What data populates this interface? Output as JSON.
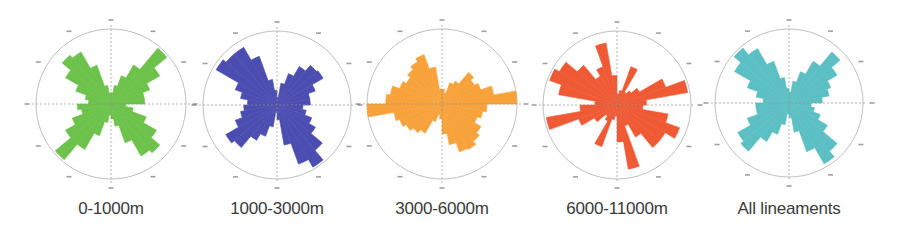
{
  "chart_data": [
    {
      "type": "rose",
      "title": "0-1000m",
      "label": "0-1000m",
      "color": "#6cc24a",
      "center": [
        111,
        104
      ],
      "radius": 75,
      "bin_width_deg": 10,
      "bin_starts_deg": [
        0,
        10,
        20,
        30,
        40,
        50,
        60,
        70,
        80,
        90,
        100,
        110,
        120,
        130,
        140,
        150,
        160,
        170,
        180,
        190,
        200,
        210,
        220,
        230,
        240,
        250,
        260,
        270,
        280,
        290,
        300,
        310,
        320,
        330,
        340,
        350
      ],
      "values": [
        0.15,
        0.25,
        0.4,
        0.6,
        0.97,
        0.75,
        0.55,
        0.45,
        0.45,
        0.2,
        0.3,
        0.5,
        0.7,
        0.85,
        0.8,
        0.55,
        0.3,
        0.2,
        0.15,
        0.25,
        0.45,
        0.7,
        0.97,
        0.7,
        0.55,
        0.4,
        0.45,
        0.3,
        0.35,
        0.5,
        0.7,
        0.85,
        0.8,
        0.55,
        0.25,
        0.15
      ],
      "value_scale": "fraction of outer circle radius",
      "grid": true,
      "direction_ticks": [
        "N",
        "E",
        "S",
        "W"
      ]
    },
    {
      "type": "rose",
      "title": "1000-3000m",
      "label": "1000-3000m",
      "color": "#4b4db0",
      "center": [
        277,
        105
      ],
      "radius": 74,
      "bin_width_deg": 10,
      "bin_starts_deg": [
        0,
        10,
        20,
        30,
        40,
        50,
        60,
        70,
        80,
        90,
        100,
        110,
        120,
        130,
        140,
        150,
        160,
        170,
        180,
        190,
        200,
        210,
        220,
        230,
        240,
        250,
        260,
        270,
        280,
        290,
        300,
        310,
        320,
        330,
        340,
        350
      ],
      "values": [
        0.1,
        0.3,
        0.45,
        0.6,
        0.7,
        0.72,
        0.55,
        0.45,
        0.45,
        0.35,
        0.4,
        0.5,
        0.6,
        0.8,
        0.97,
        0.85,
        0.55,
        0.2,
        0.1,
        0.3,
        0.45,
        0.55,
        0.75,
        0.8,
        0.6,
        0.5,
        0.45,
        0.4,
        0.5,
        0.6,
        0.95,
        0.9,
        0.9,
        0.7,
        0.35,
        0.2
      ],
      "value_scale": "fraction of outer circle radius",
      "grid": true,
      "direction_ticks": [
        "N",
        "E",
        "S",
        "W"
      ]
    },
    {
      "type": "rose",
      "title": "3000-6000m",
      "label": "3000-6000m",
      "color": "#f7a23b",
      "center": [
        442,
        104
      ],
      "radius": 75,
      "bin_width_deg": 10,
      "bin_starts_deg": [
        0,
        10,
        20,
        30,
        40,
        50,
        60,
        70,
        80,
        90,
        100,
        110,
        120,
        130,
        140,
        150,
        160,
        170,
        180,
        190,
        200,
        210,
        220,
        230,
        240,
        250,
        260,
        270,
        280,
        290,
        300,
        310,
        320,
        330,
        340,
        350
      ],
      "values": [
        0.2,
        0.15,
        0.3,
        0.35,
        0.55,
        0.5,
        0.55,
        0.7,
        1.0,
        0.6,
        0.55,
        0.5,
        0.6,
        0.65,
        0.7,
        0.68,
        0.55,
        0.4,
        0.2,
        0.15,
        0.25,
        0.45,
        0.5,
        0.55,
        0.6,
        0.65,
        1.0,
        0.75,
        0.7,
        0.6,
        0.55,
        0.6,
        0.65,
        0.7,
        0.5,
        0.2
      ],
      "value_scale": "fraction of outer circle radius",
      "grid": true,
      "direction_ticks": [
        "N",
        "E",
        "S",
        "W"
      ]
    },
    {
      "type": "rose",
      "title": "6000-11000m",
      "label": "6000-11000m",
      "color": "#ef5a35",
      "center": [
        617,
        105
      ],
      "radius": 74,
      "bin_width_deg": 10,
      "bin_starts_deg": [
        0,
        10,
        20,
        30,
        40,
        50,
        60,
        70,
        80,
        90,
        100,
        110,
        120,
        130,
        140,
        150,
        160,
        170,
        180,
        190,
        200,
        210,
        220,
        230,
        240,
        250,
        260,
        270,
        280,
        290,
        300,
        310,
        320,
        330,
        340,
        350
      ],
      "values": [
        0.15,
        0.2,
        0.55,
        0.2,
        0.25,
        0.35,
        0.7,
        0.97,
        0.4,
        0.35,
        0.7,
        0.9,
        0.75,
        0.75,
        0.5,
        0.3,
        0.88,
        0.5,
        0.15,
        0.2,
        0.6,
        0.25,
        0.2,
        0.35,
        0.55,
        0.97,
        0.5,
        0.3,
        0.8,
        0.97,
        0.9,
        0.7,
        0.45,
        0.55,
        0.85,
        0.4
      ],
      "value_scale": "fraction of outer circle radius",
      "grid": true,
      "direction_ticks": [
        "N",
        "E",
        "S",
        "W"
      ]
    },
    {
      "type": "rose",
      "title": "All lineaments",
      "label": "All lineaments",
      "color": "#5cbfc3",
      "center": [
        789,
        103
      ],
      "radius": 74,
      "bin_width_deg": 10,
      "bin_starts_deg": [
        0,
        10,
        20,
        30,
        40,
        50,
        60,
        70,
        80,
        90,
        100,
        110,
        120,
        130,
        140,
        150,
        160,
        170,
        180,
        190,
        200,
        210,
        220,
        230,
        240,
        250,
        260,
        270,
        280,
        290,
        300,
        310,
        320,
        330,
        340,
        350
      ],
      "values": [
        0.15,
        0.3,
        0.45,
        0.65,
        0.9,
        0.75,
        0.6,
        0.55,
        0.45,
        0.3,
        0.35,
        0.45,
        0.6,
        0.85,
        0.95,
        0.7,
        0.4,
        0.2,
        0.15,
        0.3,
        0.45,
        0.6,
        0.85,
        0.8,
        0.6,
        0.45,
        0.45,
        0.35,
        0.45,
        0.6,
        0.85,
        0.97,
        0.85,
        0.6,
        0.35,
        0.2
      ],
      "value_scale": "fraction of outer circle radius",
      "grid": true,
      "direction_ticks": [
        "N",
        "E",
        "S",
        "W"
      ]
    }
  ],
  "style": {
    "circle_stroke": "#b8b8b8",
    "axis_stroke": "#9a9a9a",
    "tick_color": "#777777",
    "label_color": "#3a3a3a"
  }
}
